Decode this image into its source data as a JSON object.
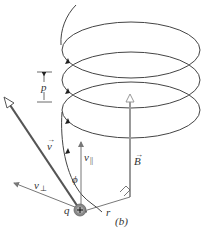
{
  "figure": {
    "caption": "(b)",
    "labels": {
      "pitch": "p",
      "velocity": "v",
      "v_parallel": "v",
      "v_parallel_sub": "||",
      "v_perp": "v",
      "v_perp_sub": "⊥",
      "angle": "ϕ",
      "charge": "q",
      "radius": "r",
      "field": "B"
    },
    "colors": {
      "helix": "#444444",
      "velocity_vector": "#555555",
      "field_vector": "#999999",
      "component_vectors": "#777777",
      "charge_fill": "#888888"
    }
  }
}
